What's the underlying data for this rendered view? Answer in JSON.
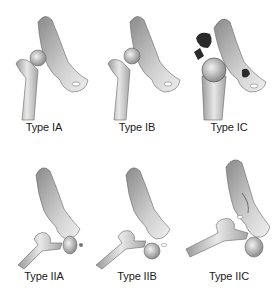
{
  "figure": {
    "panels": [
      {
        "id": "IA",
        "label": "Type IA",
        "row": 0,
        "col": 0
      },
      {
        "id": "IB",
        "label": "Type IB",
        "row": 0,
        "col": 1
      },
      {
        "id": "IC",
        "label": "Type IC",
        "row": 0,
        "col": 2
      },
      {
        "id": "IIA",
        "label": "Type IIA",
        "row": 1,
        "col": 0
      },
      {
        "id": "IIB",
        "label": "Type IIB",
        "row": 1,
        "col": 1
      },
      {
        "id": "IIC",
        "label": "Type IIC",
        "row": 1,
        "col": 2
      }
    ],
    "colors": {
      "bone_light": "#e6e6e6",
      "bone_mid": "#b8b8b8",
      "bone_dark": "#7a7a7a",
      "outline": "#555555",
      "fragment": "#2a2a2a",
      "text": "#1a1a1a"
    }
  }
}
